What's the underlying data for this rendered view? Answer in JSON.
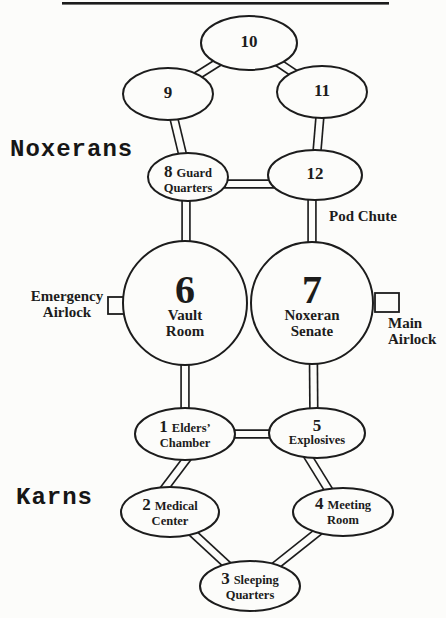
{
  "diagram": {
    "factions": {
      "noxerans": "Noxerans",
      "karns": "Karns"
    },
    "rooms": {
      "r1": {
        "number": "1",
        "inline": "Elders’",
        "line2": "Chamber"
      },
      "r2": {
        "number": "2",
        "inline": "Medical",
        "line2": "Center"
      },
      "r3": {
        "number": "3",
        "inline": "Sleeping",
        "line2": "Quarters"
      },
      "r4": {
        "number": "4",
        "inline": "Meeting",
        "line2": "Room"
      },
      "r5": {
        "number": "5",
        "line2": "Explosives"
      },
      "r6": {
        "number": "6",
        "name_line1": "Vault",
        "name_line2": "Room"
      },
      "r7": {
        "number": "7",
        "name_line1": "Noxeran",
        "name_line2": "Senate"
      },
      "r8": {
        "number": "8",
        "inline": "Guard",
        "line2": "Quarters"
      },
      "r9": {
        "number": "9"
      },
      "r10": {
        "number": "10"
      },
      "r11": {
        "number": "11"
      },
      "r12": {
        "number": "12"
      }
    },
    "annotations": {
      "pod_chute": "Pod Chute",
      "emergency_airlock": [
        "Emergency",
        "Airlock"
      ],
      "main_airlock": [
        "Main",
        "Airlock"
      ]
    },
    "colors": {
      "ink": "#1c1c1c",
      "paper": "#fcfcfa"
    }
  }
}
